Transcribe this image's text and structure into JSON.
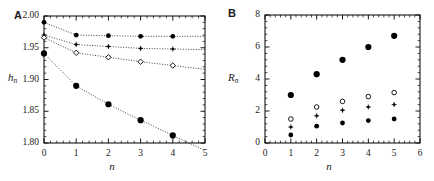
{
  "figure": {
    "panels": [
      {
        "id": "A",
        "label": "A",
        "xlabel": "n",
        "ylabel_base": "h",
        "ylabel_sub": "n",
        "xticks": [
          "0",
          "1",
          "2",
          "3",
          "4",
          "5"
        ],
        "yticks": [
          "1.80",
          "1.85",
          "1.90",
          "1.95",
          "2.00"
        ]
      },
      {
        "id": "B",
        "label": "B",
        "xlabel": "n",
        "ylabel_base": "R",
        "ylabel_sub": "n",
        "xticks": [
          "0",
          "1",
          "2",
          "3",
          "4",
          "5",
          "6"
        ],
        "yticks": [
          "0",
          "2",
          "4",
          "6",
          "8"
        ]
      }
    ]
  },
  "chart_data": [
    {
      "type": "scatter",
      "panel": "A",
      "title": "A",
      "xlabel": "n",
      "ylabel": "h_n",
      "xlim": [
        0,
        5
      ],
      "ylim": [
        1.8,
        2.0
      ],
      "xticks": [
        0,
        1,
        2,
        3,
        4,
        5
      ],
      "yticks": [
        1.8,
        1.85,
        1.9,
        1.95,
        2.0
      ],
      "grid": false,
      "legend": "none",
      "connector": "dotted-line",
      "series": [
        {
          "name": "series-1-filled-circle",
          "marker": "filled-circle",
          "x": [
            0,
            1,
            2,
            3,
            4
          ],
          "y": [
            1.99,
            1.97,
            1.969,
            1.968,
            1.968
          ]
        },
        {
          "name": "series-2-plus",
          "marker": "plus",
          "x": [
            0,
            1,
            2,
            3,
            4
          ],
          "y": [
            1.97,
            1.955,
            1.952,
            1.949,
            1.948
          ]
        },
        {
          "name": "series-3-open-diamond",
          "marker": "open-diamond",
          "x": [
            0,
            1,
            2,
            3,
            4
          ],
          "y": [
            1.966,
            1.942,
            1.935,
            1.928,
            1.922
          ]
        },
        {
          "name": "series-4-large-filled-circle",
          "marker": "large-filled-circle",
          "x": [
            0,
            1,
            2,
            3,
            4
          ],
          "y": [
            1.941,
            1.89,
            1.861,
            1.836,
            1.812
          ]
        }
      ]
    },
    {
      "type": "scatter",
      "panel": "B",
      "title": "B",
      "xlabel": "n",
      "ylabel": "R_n",
      "xlim": [
        0,
        6
      ],
      "ylim": [
        0,
        8
      ],
      "xticks": [
        0,
        1,
        2,
        3,
        4,
        5,
        6
      ],
      "yticks": [
        0,
        2,
        4,
        6,
        8
      ],
      "grid": false,
      "legend": "none",
      "connector": "none",
      "series": [
        {
          "name": "series-1-large-filled-circle",
          "marker": "large-filled-circle",
          "x": [
            1,
            2,
            3,
            4,
            5
          ],
          "y": [
            3.0,
            4.3,
            5.2,
            6.0,
            6.7
          ]
        },
        {
          "name": "series-2-open-circle",
          "marker": "open-circle",
          "x": [
            1,
            2,
            3,
            4,
            5
          ],
          "y": [
            1.5,
            2.25,
            2.6,
            2.9,
            3.15
          ]
        },
        {
          "name": "series-3-plus",
          "marker": "plus",
          "x": [
            1,
            2,
            3,
            4,
            5
          ],
          "y": [
            1.0,
            1.7,
            2.05,
            2.25,
            2.4
          ]
        },
        {
          "name": "series-4-filled-circle",
          "marker": "filled-circle",
          "x": [
            1,
            2,
            3,
            4,
            5
          ],
          "y": [
            0.5,
            1.05,
            1.25,
            1.4,
            1.5
          ]
        }
      ]
    }
  ]
}
